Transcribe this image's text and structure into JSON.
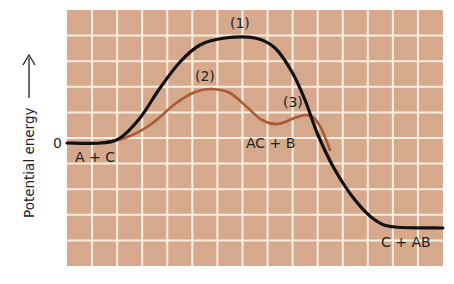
{
  "chart_data": {
    "type": "line",
    "title": "",
    "xlabel": "",
    "ylabel": "Potential energy",
    "ylabel_arrow": "up-arrow",
    "zero_label": "0",
    "grid": true,
    "colors": {
      "background": "#d6a98c",
      "gridline": "#fbefe2",
      "series_1": "#111111",
      "series_2": "#a85a34"
    },
    "series": [
      {
        "name": "(1)",
        "description": "uncatalyzed path, single large barrier",
        "color": "#111111",
        "points_px": [
          [
            67,
            143
          ],
          [
            100,
            143
          ],
          [
            120,
            138
          ],
          [
            140,
            118
          ],
          [
            160,
            88
          ],
          [
            180,
            62
          ],
          [
            200,
            45
          ],
          [
            225,
            38
          ],
          [
            255,
            38
          ],
          [
            275,
            48
          ],
          [
            292,
            72
          ],
          [
            305,
            100
          ],
          [
            318,
            135
          ],
          [
            335,
            170
          ],
          [
            355,
            200
          ],
          [
            375,
            220
          ],
          [
            395,
            227
          ],
          [
            443,
            228
          ]
        ]
      },
      {
        "name": "(2)/(3)",
        "description": "catalyzed path, two smaller barriers via intermediate AC + B",
        "color": "#a85a34",
        "points_px": [
          [
            100,
            143
          ],
          [
            125,
            138
          ],
          [
            150,
            125
          ],
          [
            175,
            104
          ],
          [
            195,
            92
          ],
          [
            212,
            89
          ],
          [
            230,
            93
          ],
          [
            248,
            108
          ],
          [
            262,
            120
          ],
          [
            278,
            124
          ],
          [
            292,
            119
          ],
          [
            305,
            115
          ],
          [
            314,
            118
          ],
          [
            322,
            130
          ],
          [
            330,
            150
          ]
        ]
      }
    ],
    "annotations": [
      {
        "text": "(1)",
        "x": 240,
        "y": 25
      },
      {
        "text": "(2)",
        "x": 205,
        "y": 78
      },
      {
        "text": "(3)",
        "x": 303,
        "y": 106
      },
      {
        "text": "A + C",
        "x": 76,
        "y": 160
      },
      {
        "text": "AC + B",
        "x": 245,
        "y": 148
      },
      {
        "text": "C + AB",
        "x": 380,
        "y": 246
      }
    ],
    "levels": {
      "reactants": {
        "label": "A + C",
        "energy": 0
      },
      "peak_1": {
        "label": "(1)",
        "energy_rel": 4.1
      },
      "peak_2": {
        "label": "(2)",
        "energy_rel": 2.1
      },
      "intermediate": {
        "label": "AC + B",
        "energy_rel": 0.75
      },
      "peak_3": {
        "label": "(3)",
        "energy_rel": 1.1
      },
      "products": {
        "label": "C + AB",
        "energy_rel": -3.3
      }
    },
    "grid_cells": {
      "columns": 15,
      "rows": 10
    }
  },
  "labels": {
    "ylabel": "Potential energy",
    "zero": "0",
    "peak1": "(1)",
    "peak2": "(2)",
    "peak3": "(3)",
    "reactants": "A + C",
    "intermediate": "AC + B",
    "products": "C + AB"
  }
}
